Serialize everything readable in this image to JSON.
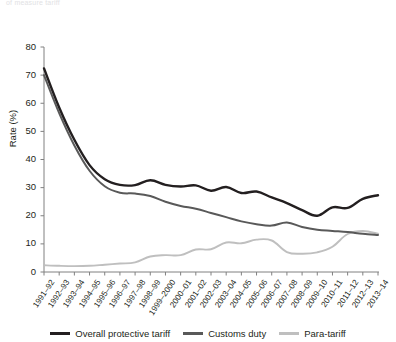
{
  "figure": {
    "cropped_header_text": "of measure tariff",
    "ylabel": "Rate (%)"
  },
  "legend": {
    "position": "bottom-center",
    "items": [
      {
        "label": "Overall protective tariff",
        "color": "#231f20",
        "name": "legend-overall-protective-tariff"
      },
      {
        "label": "Customs duty",
        "color": "#595959",
        "name": "legend-customs-duty"
      },
      {
        "label": "Para-tariff",
        "color": "#bfbfbf",
        "name": "legend-para-tariff"
      }
    ]
  },
  "chart_data": {
    "type": "line",
    "title": "",
    "subtitle": "",
    "xlabel": "",
    "ylabel": "Rate (%)",
    "ylim": [
      0,
      80
    ],
    "yticks": [
      0,
      10,
      20,
      30,
      40,
      50,
      60,
      70,
      80
    ],
    "grid": false,
    "legend_position": "bottom-center",
    "categories": [
      "1991–92",
      "1992–93",
      "1993–94",
      "1994–95",
      "1995–96",
      "1996–97",
      "1997–98",
      "1998–99",
      "1999–2000",
      "2000–01",
      "2001–02",
      "2002–03",
      "2003–04",
      "2004–05",
      "2005–06",
      "2006–07",
      "2007–08",
      "2008–09",
      "2009–10",
      "2010–11",
      "2011–12",
      "2012–13",
      "2013–14"
    ],
    "series": [
      {
        "name": "Overall protective tariff",
        "color": "#231f20",
        "values": [
          72.4,
          58.5,
          47.0,
          38.0,
          33.0,
          31.0,
          30.9,
          32.6,
          31.0,
          30.4,
          30.8,
          28.9,
          30.2,
          28.1,
          28.6,
          26.5,
          24.5,
          22.0,
          20.0,
          23.0,
          22.8,
          26.0,
          27.3
        ]
      },
      {
        "name": "Customs duty",
        "color": "#595959",
        "values": [
          70.0,
          56.5,
          45.0,
          36.0,
          30.5,
          28.2,
          27.9,
          27.0,
          25.0,
          23.5,
          22.5,
          21.0,
          19.5,
          18.0,
          17.0,
          16.5,
          17.6,
          16.0,
          15.0,
          14.6,
          14.2,
          13.6,
          13.2
        ]
      },
      {
        "name": "Para-tariff",
        "color": "#bfbfbf",
        "values": [
          2.4,
          2.2,
          2.1,
          2.2,
          2.6,
          3.0,
          3.4,
          5.5,
          6.0,
          6.0,
          8.0,
          8.1,
          10.5,
          10.2,
          11.5,
          11.2,
          7.1,
          6.5,
          7.0,
          9.0,
          13.5,
          14.6,
          13.6
        ]
      }
    ]
  }
}
